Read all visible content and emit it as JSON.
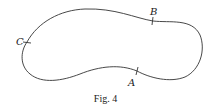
{
  "figure": {
    "caption": "Fig. 4",
    "curve_color": "#333333",
    "points": [
      {
        "id": "A",
        "label": "A"
      },
      {
        "id": "B",
        "label": "B"
      },
      {
        "id": "C",
        "label": "C"
      }
    ]
  }
}
